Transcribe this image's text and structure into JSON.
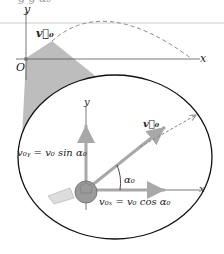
{
  "top_fragment": "g          g  α₀",
  "upper_diagram": {
    "y_axis": "y",
    "x_axis": "x",
    "origin": "O",
    "velocity": "v⃗₀"
  },
  "inset": {
    "y_axis": "y",
    "x_axis": "x",
    "velocity": "v⃗₀",
    "vy_label": "v₀ᵧ = v₀ sin α₀",
    "vx_label": "v₀ₓ = v₀ cos α₀",
    "angle": "α₀"
  },
  "colors": {
    "cone": "#b9b9b9",
    "vector": "#a8a8a8",
    "dash": "#888888",
    "ellipse": "#111111"
  }
}
